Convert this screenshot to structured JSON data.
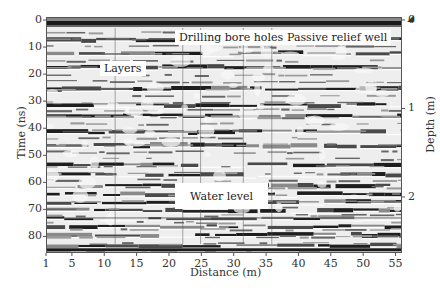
{
  "chart_data": {
    "type": "heatmap",
    "title": "",
    "subtitle": "GPR radargram (grayscale reflection profile)",
    "xlabel": "Distance (m)",
    "ylabel": "Time (ns)",
    "y2label": "Depth (m)",
    "xlim": [
      1,
      56
    ],
    "ylim": [
      0,
      85
    ],
    "y2lim": [
      0,
      2.6
    ],
    "x_ticks": [
      1,
      5,
      10,
      15,
      20,
      25,
      30,
      35,
      40,
      45,
      50,
      55
    ],
    "y_ticks": [
      0,
      10,
      20,
      30,
      40,
      50,
      60,
      70,
      80
    ],
    "y2_ticks": [
      0,
      1,
      2
    ],
    "grid": false,
    "legend": null,
    "colormap": "grayscale",
    "annotations": [
      {
        "text": "Drilling bore holes",
        "x": 23,
        "y": 2
      },
      {
        "text": "Passive relief well",
        "x": 44,
        "y": 2
      },
      {
        "text": "Layers",
        "x": 10,
        "y": 17
      },
      {
        "text": "Water level",
        "x": 24,
        "y": 71
      }
    ],
    "features": {
      "strong_reflectors_ns": [
        1,
        7,
        12,
        17,
        25,
        31,
        35,
        41,
        46,
        53,
        57,
        61,
        64,
        67,
        70,
        73,
        76,
        79,
        83
      ],
      "water_level_ns": 73,
      "surface_ns": 1
    }
  },
  "axes": {
    "x_title": "Distance (m)",
    "y_title": "Time (ns)",
    "y2_title": "Depth (m)",
    "x_ticks": [
      "1",
      "5",
      "10",
      "15",
      "20",
      "25",
      "30",
      "35",
      "40",
      "45",
      "50",
      "55"
    ],
    "y_ticks": [
      "0",
      "10",
      "20",
      "30",
      "40",
      "50",
      "60",
      "70",
      "80"
    ],
    "y2_ticks": [
      "0",
      "1",
      "2"
    ]
  },
  "annotations": {
    "drilling": "Drilling bore holes",
    "relief": "Passive relief well",
    "layers": "Layers",
    "water": "Water level"
  }
}
